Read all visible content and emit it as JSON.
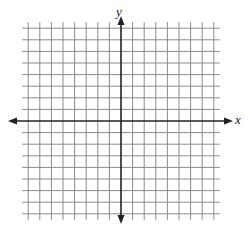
{
  "diagram": {
    "type": "coordinate-plane",
    "x_axis_label": "x",
    "y_axis_label": "y",
    "grid": {
      "cells_left_of_y_axis": 8,
      "cells_right_of_y_axis": 8,
      "cells_above_x_axis": 8,
      "cells_below_x_axis": 8,
      "tick_labels": "none"
    },
    "colors": {
      "grid_line": "#8a8a8a",
      "axis": "#222222",
      "background": "#ffffff"
    }
  }
}
